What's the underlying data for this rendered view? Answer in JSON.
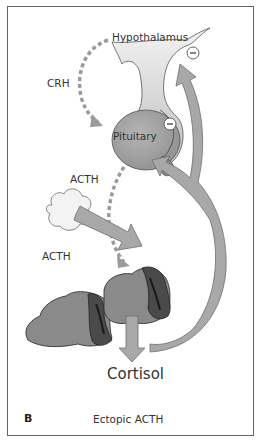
{
  "diagram": {
    "panel_letter": "B",
    "caption": "Ectopic ACTH",
    "nodes": {
      "hypothalamus": "Hypothalamus",
      "pituitary": "Pituitary",
      "output": "Cortisol"
    },
    "hormones": {
      "crh": "CRH",
      "acth_pituitary": "ACTH",
      "acth_ectopic": "ACTH"
    },
    "feedback": [
      {
        "target": "Hypothalamus",
        "symbol": "−"
      },
      {
        "target": "Pituitary",
        "symbol": "−"
      }
    ],
    "colors": {
      "arrow_fill": "#a8a8a8",
      "arrow_stroke": "#6e6e6e",
      "pituitary": "#a0a0a0",
      "adrenal_cortex": "#8a8a8a",
      "adrenal_medulla": "#4a4a4a",
      "dashed_arrow": "#9a9a9a"
    }
  }
}
